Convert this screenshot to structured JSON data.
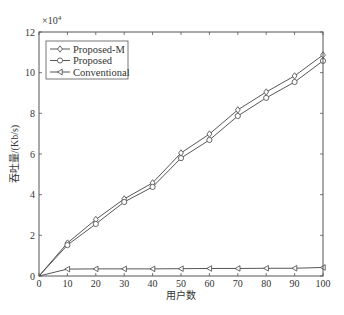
{
  "chart_data": {
    "type": "line",
    "title": "",
    "xlabel": "用户数",
    "ylabel": "吞吐量/(Kb/s)",
    "y_scale_annotation": "×10^4",
    "xlim": [
      0,
      100
    ],
    "ylim": [
      0,
      12
    ],
    "x_ticks": [
      0,
      10,
      20,
      30,
      40,
      50,
      60,
      70,
      80,
      90,
      100
    ],
    "y_ticks": [
      0,
      2,
      4,
      6,
      8,
      10,
      12
    ],
    "grid": false,
    "legend_position": "upper left",
    "x": [
      0,
      10,
      20,
      30,
      40,
      50,
      60,
      70,
      80,
      90,
      100
    ],
    "series": [
      {
        "name": "Proposed-M",
        "marker": "diamond",
        "values": [
          0,
          1.62,
          2.78,
          3.79,
          4.58,
          6.05,
          6.98,
          8.17,
          9.05,
          9.84,
          10.87
        ]
      },
      {
        "name": "Proposed",
        "marker": "circle",
        "values": [
          0,
          1.52,
          2.56,
          3.64,
          4.38,
          5.8,
          6.69,
          7.87,
          8.76,
          9.54,
          10.58
        ]
      },
      {
        "name": "Conventional",
        "marker": "triangle-left",
        "values": [
          0,
          0.34,
          0.35,
          0.35,
          0.35,
          0.36,
          0.37,
          0.37,
          0.38,
          0.38,
          0.42
        ]
      }
    ],
    "colors": {
      "axis": "#555555",
      "line": "#444444",
      "background": "#ffffff"
    }
  }
}
